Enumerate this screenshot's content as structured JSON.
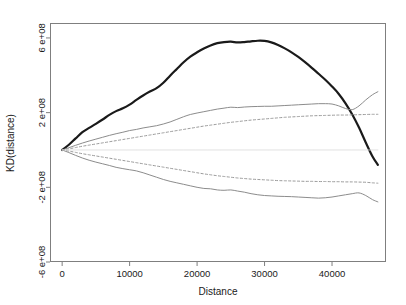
{
  "chart_data": {
    "type": "line",
    "title": "",
    "xlabel": "Distance",
    "ylabel": "KD(distance)",
    "xlim": [
      -1800,
      48000
    ],
    "ylim": [
      -600000000,
      680000000
    ],
    "xticks": [
      0,
      10000,
      20000,
      30000,
      40000
    ],
    "xticklabels": [
      "0",
      "10000",
      "20000",
      "30000",
      "40000"
    ],
    "yticks": [
      600000000,
      200000000,
      -200000000,
      -600000000
    ],
    "yticklabels": [
      "6 e+08",
      "2 e+08",
      "-2 e+08",
      "-6 e+08"
    ],
    "grid": false,
    "legend": "none",
    "colors": {
      "observed": "#1a1a1a",
      "envelope": "#8c8c8c",
      "confidence": "#9a9a9a",
      "frame": "#7f7f7f",
      "background": "#ffffff"
    },
    "series": [
      {
        "name": "observed KD",
        "style": "solid",
        "width": 2.2,
        "color": "#1a1a1a",
        "x": [
          0,
          1000,
          2000,
          3000,
          4000,
          5000,
          6000,
          7000,
          8000,
          9000,
          10000,
          11000,
          12000,
          13000,
          14000,
          15000,
          16000,
          17000,
          18000,
          19000,
          20000,
          21000,
          22000,
          23000,
          24000,
          25000,
          26000,
          27000,
          28000,
          29000,
          30000,
          31000,
          32000,
          33000,
          34000,
          35000,
          36000,
          37000,
          38000,
          39000,
          40000,
          41000,
          42000,
          43000,
          44000,
          45000,
          46000,
          46800
        ],
        "y": [
          0,
          28000000,
          62000000,
          95000000,
          118000000,
          140000000,
          163000000,
          188000000,
          208000000,
          223000000,
          243000000,
          268000000,
          292000000,
          313000000,
          331000000,
          360000000,
          398000000,
          434000000,
          470000000,
          500000000,
          523000000,
          543000000,
          560000000,
          572000000,
          578000000,
          580000000,
          576000000,
          578000000,
          582000000,
          585000000,
          584000000,
          576000000,
          562000000,
          544000000,
          523000000,
          498000000,
          470000000,
          440000000,
          408000000,
          376000000,
          340000000,
          300000000,
          250000000,
          190000000,
          120000000,
          40000000,
          -35000000,
          -80000000
        ]
      },
      {
        "name": "upper envelope",
        "style": "solid",
        "width": 1,
        "color": "#8c8c8c",
        "x": [
          0,
          1000,
          2000,
          3000,
          4000,
          5000,
          6000,
          7000,
          8000,
          9000,
          10000,
          11000,
          12000,
          13000,
          14000,
          15000,
          16000,
          17000,
          18000,
          19000,
          20000,
          21000,
          22000,
          23000,
          24000,
          25000,
          26000,
          27000,
          28000,
          29000,
          30000,
          31000,
          32000,
          33000,
          34000,
          35000,
          36000,
          37000,
          38000,
          39000,
          40000,
          41000,
          42000,
          43000,
          44000,
          45000,
          46000,
          46800
        ],
        "y": [
          0,
          12000000,
          25000000,
          37000000,
          48000000,
          58000000,
          68000000,
          78000000,
          87000000,
          95000000,
          104000000,
          110000000,
          118000000,
          124000000,
          130000000,
          139000000,
          150000000,
          164000000,
          178000000,
          190000000,
          198000000,
          205000000,
          212000000,
          219000000,
          224000000,
          229000000,
          227000000,
          230000000,
          232000000,
          233000000,
          234000000,
          234000000,
          236000000,
          238000000,
          240000000,
          242000000,
          244000000,
          246000000,
          248000000,
          248000000,
          246000000,
          236000000,
          222000000,
          216000000,
          236000000,
          268000000,
          296000000,
          312000000
        ]
      },
      {
        "name": "upper confidence band",
        "style": "dotted",
        "width": 1,
        "color": "#9a9a9a",
        "x": [
          0,
          1000,
          2000,
          3000,
          4000,
          5000,
          6000,
          7000,
          8000,
          9000,
          10000,
          11000,
          12000,
          13000,
          14000,
          15000,
          16000,
          17000,
          18000,
          19000,
          20000,
          21000,
          22000,
          23000,
          24000,
          25000,
          26000,
          27000,
          28000,
          29000,
          30000,
          31000,
          32000,
          33000,
          34000,
          35000,
          36000,
          37000,
          38000,
          39000,
          40000,
          41000,
          42000,
          43000,
          44000,
          45000,
          46000,
          46800
        ],
        "y": [
          0,
          6000000,
          13000000,
          20000000,
          26000000,
          32000000,
          38000000,
          44000000,
          50000000,
          56000000,
          62000000,
          68000000,
          74000000,
          80000000,
          86000000,
          92000000,
          98000000,
          104000000,
          110000000,
          116000000,
          122000000,
          128000000,
          133000000,
          138000000,
          143000000,
          148000000,
          152000000,
          156000000,
          160000000,
          163000000,
          166000000,
          169000000,
          172000000,
          175000000,
          177000000,
          179000000,
          181000000,
          183000000,
          184000000,
          185000000,
          186000000,
          187000000,
          187000000,
          188000000,
          189000000,
          190000000,
          191000000,
          191000000
        ]
      },
      {
        "name": "lower confidence band",
        "style": "dotted",
        "width": 1,
        "color": "#9a9a9a",
        "x": [
          0,
          1000,
          2000,
          3000,
          4000,
          5000,
          6000,
          7000,
          8000,
          9000,
          10000,
          11000,
          12000,
          13000,
          14000,
          15000,
          16000,
          17000,
          18000,
          19000,
          20000,
          21000,
          22000,
          23000,
          24000,
          25000,
          26000,
          27000,
          28000,
          29000,
          30000,
          31000,
          32000,
          33000,
          34000,
          35000,
          36000,
          37000,
          38000,
          39000,
          40000,
          41000,
          42000,
          43000,
          44000,
          45000,
          46000,
          46800
        ],
        "y": [
          0,
          -6000000,
          -13000000,
          -20000000,
          -26000000,
          -32000000,
          -38000000,
          -44000000,
          -50000000,
          -56000000,
          -62000000,
          -68000000,
          -74000000,
          -80000000,
          -86000000,
          -92000000,
          -98000000,
          -104000000,
          -110000000,
          -116000000,
          -122000000,
          -128000000,
          -133000000,
          -138000000,
          -142000000,
          -146000000,
          -150000000,
          -153000000,
          -156000000,
          -158000000,
          -160000000,
          -162000000,
          -164000000,
          -165000000,
          -166000000,
          -167000000,
          -168000000,
          -168000000,
          -169000000,
          -169000000,
          -170000000,
          -170000000,
          -171000000,
          -171000000,
          -172000000,
          -173000000,
          -176000000,
          -178000000
        ]
      },
      {
        "name": "lower envelope",
        "style": "solid",
        "width": 1,
        "color": "#8c8c8c",
        "x": [
          0,
          1000,
          2000,
          3000,
          4000,
          5000,
          6000,
          7000,
          8000,
          9000,
          10000,
          11000,
          12000,
          13000,
          14000,
          15000,
          16000,
          17000,
          18000,
          19000,
          20000,
          21000,
          22000,
          23000,
          24000,
          25000,
          26000,
          27000,
          28000,
          29000,
          30000,
          31000,
          32000,
          33000,
          34000,
          35000,
          36000,
          37000,
          38000,
          39000,
          40000,
          41000,
          42000,
          43000,
          44000,
          45000,
          46000,
          46800
        ],
        "y": [
          0,
          -14000000,
          -29000000,
          -43000000,
          -55000000,
          -65000000,
          -74000000,
          -83000000,
          -93000000,
          -100000000,
          -106000000,
          -112000000,
          -122000000,
          -134000000,
          -146000000,
          -158000000,
          -168000000,
          -176000000,
          -184000000,
          -192000000,
          -200000000,
          -206000000,
          -208000000,
          -214000000,
          -216000000,
          -214000000,
          -220000000,
          -226000000,
          -234000000,
          -240000000,
          -244000000,
          -246000000,
          -248000000,
          -249000000,
          -250000000,
          -252000000,
          -254000000,
          -256000000,
          -258000000,
          -256000000,
          -252000000,
          -246000000,
          -240000000,
          -234000000,
          -230000000,
          -244000000,
          -266000000,
          -278000000
        ]
      },
      {
        "name": "zero reference",
        "style": "solid",
        "width": 0.8,
        "color": "#d8d8d8",
        "x": [
          0,
          46800
        ],
        "y": [
          0,
          0
        ]
      }
    ]
  },
  "figure": {
    "plot_left": 50,
    "plot_right": 386,
    "plot_top": 23,
    "plot_bottom": 262
  }
}
